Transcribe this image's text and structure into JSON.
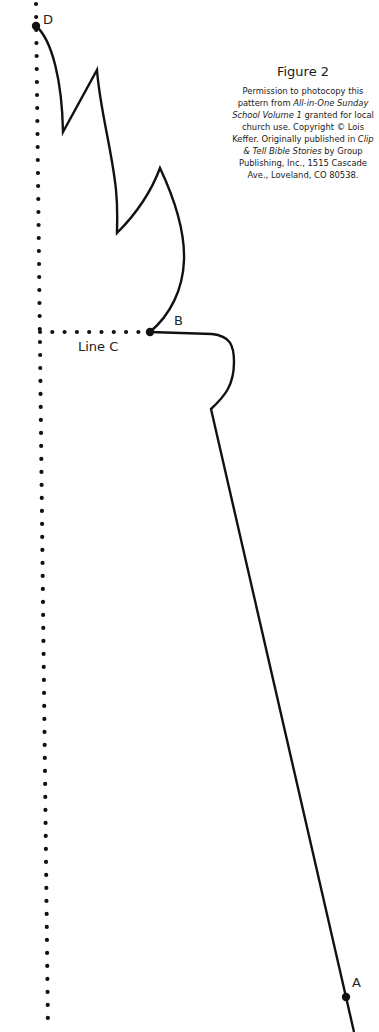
{
  "figure": {
    "title": "Figure 2",
    "caption_parts": {
      "p1": "Permission to photocopy this pattern from ",
      "book1": "All-in-One Sunday School Volume 1",
      "p2": " granted for local church use. Copyright © Lois Keffer. Originally published in ",
      "book2": "Clip & Tell Bible Stories",
      "p3": " by Group Publishing, Inc., 1515 Cascade Ave., Loveland, CO 80538."
    }
  },
  "labels": {
    "point_a": "A",
    "point_b": "B",
    "point_d": "D",
    "line_c": "Line C"
  },
  "colors": {
    "line": "#111111",
    "background": "#ffffff"
  }
}
